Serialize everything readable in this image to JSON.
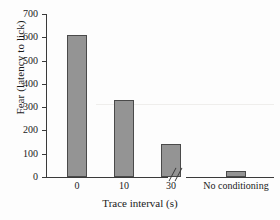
{
  "chart_data": {
    "type": "bar",
    "title": "",
    "xlabel": "Trace interval (s)",
    "ylabel": "Fear (latency to lick)",
    "categories": [
      "0",
      "10",
      "30",
      "No conditioning"
    ],
    "values": [
      610,
      330,
      140,
      25
    ],
    "ylim": [
      0,
      700
    ],
    "yticks": [
      0,
      100,
      200,
      300,
      400,
      500,
      600,
      700
    ],
    "ytick_labels": [
      "0",
      "100",
      "200",
      "300",
      "400",
      "500",
      "600",
      "700"
    ],
    "grid": false,
    "legend": "none",
    "axis_break": {
      "present": true,
      "symbol": "//",
      "position_after_category": "30"
    },
    "series": [
      {
        "name": "Fear (latency to lick)",
        "values": [
          610,
          330,
          140,
          25
        ]
      }
    ]
  },
  "style": {
    "bar_fill": "#949494",
    "bar_edge": "#4a4a4a",
    "axis_color": "#3a3a3a",
    "background": "#fdfdfd",
    "text_color": "#1a1a1a"
  }
}
